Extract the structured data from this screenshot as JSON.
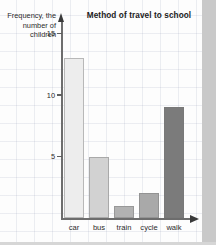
{
  "chart_data": {
    "type": "bar",
    "title": "Method of travel to school",
    "xlabel": "",
    "ylabel": "Frequency, the number of children",
    "categories": [
      "car",
      "bus",
      "train",
      "cycle",
      "walk"
    ],
    "values": [
      13,
      5,
      1,
      2,
      9
    ],
    "ylim": [
      0,
      15.8
    ],
    "yticks": [
      5,
      10,
      15
    ],
    "ytick_labels": [
      "5",
      "10",
      "15"
    ],
    "grid": true,
    "legend": "none",
    "bar_colors": [
      "#ededed",
      "#d2d2d2",
      "#b2b2b2",
      "#a9a9a9",
      "#7b7b7b"
    ],
    "axis_color": "#6d6d6d",
    "background": "#fdfdfd",
    "grid_color": "#96a0b9"
  },
  "ylabel_lines": {
    "line1": "Frequency, the",
    "line2": "number of",
    "line3": "children"
  }
}
